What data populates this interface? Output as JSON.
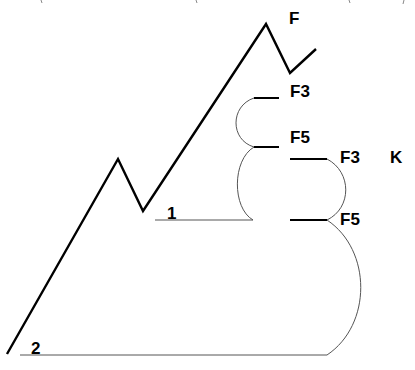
{
  "diagram": {
    "labels": {
      "peak": "F",
      "upper_f3": "F3",
      "upper_f5": "F5",
      "right_f3": "F3",
      "right_k": "K",
      "right_f5": "F5",
      "baseline_1": "1",
      "baseline_2": "2"
    }
  }
}
